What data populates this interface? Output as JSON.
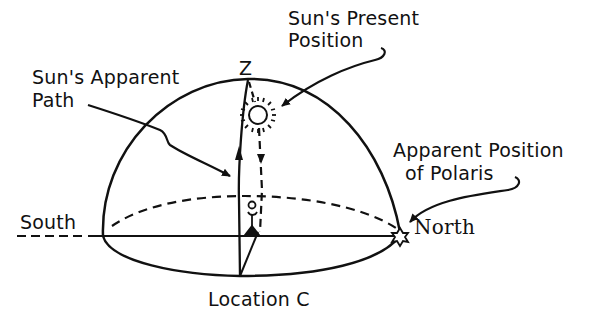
{
  "diagram": {
    "type": "celestial-dome",
    "labels": {
      "zenith": "Z",
      "sun_present_position": [
        "Sun's Present",
        "Position"
      ],
      "sun_apparent_path": [
        "Sun's Apparent",
        "Path"
      ],
      "polaris": [
        "Apparent Position",
        "of Polaris"
      ],
      "south": "South",
      "north": "North",
      "location": "Location C"
    },
    "elements": [
      "celestial dome (hemisphere)",
      "horizon line",
      "horizon ellipse (front solid, back dashed)",
      "meridian arc with upward arrow",
      "dashed sun-to-horizon line with downward arrows",
      "sun symbol",
      "observer stick figure",
      "Polaris star at north horizon"
    ],
    "colors": {
      "ink": "#111111",
      "background": "#ffffff"
    }
  }
}
